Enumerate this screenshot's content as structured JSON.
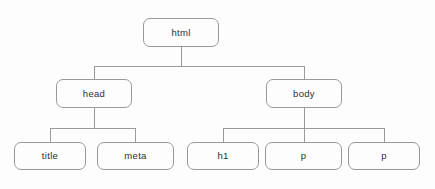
{
  "diagram": {
    "type": "tree-diagram",
    "style": {
      "background": "#fdfdfd",
      "node_border": "#9a9a9a",
      "node_fill": "#fdfdfd",
      "connector": "#9a9a9a",
      "text": "#2e2e2e"
    },
    "nodes": [
      {
        "id": "html",
        "label": "html",
        "level": 0,
        "x": 143,
        "y": 18,
        "w": 76,
        "h": 29
      },
      {
        "id": "head",
        "label": "head",
        "level": 1,
        "x": 56,
        "y": 79,
        "w": 76,
        "h": 29
      },
      {
        "id": "body",
        "label": "body",
        "level": 1,
        "x": 266,
        "y": 79,
        "w": 76,
        "h": 29
      },
      {
        "id": "title",
        "label": "title",
        "level": 2,
        "x": 14,
        "y": 142,
        "w": 72,
        "h": 28
      },
      {
        "id": "meta",
        "label": "meta",
        "level": 2,
        "x": 97,
        "y": 142,
        "w": 77,
        "h": 28
      },
      {
        "id": "h1",
        "label": "h1",
        "level": 2,
        "x": 187,
        "y": 142,
        "w": 72,
        "h": 28
      },
      {
        "id": "p1",
        "label": "p",
        "level": 2,
        "x": 265,
        "y": 142,
        "w": 77,
        "h": 28
      },
      {
        "id": "p2",
        "label": "p",
        "level": 2,
        "x": 348,
        "y": 142,
        "w": 72,
        "h": 28
      }
    ],
    "edges": [
      {
        "from": "html",
        "to": "head"
      },
      {
        "from": "html",
        "to": "body"
      },
      {
        "from": "head",
        "to": "title"
      },
      {
        "from": "head",
        "to": "meta"
      },
      {
        "from": "body",
        "to": "h1"
      },
      {
        "from": "body",
        "to": "p1"
      },
      {
        "from": "body",
        "to": "p2"
      }
    ],
    "connectors": {
      "html_stem": {
        "x": 181,
        "y1": 47,
        "y2": 66
      },
      "html_bar": {
        "y": 66,
        "x1": 94,
        "x2": 304
      },
      "html_drop_head": {
        "x": 94,
        "y1": 66,
        "y2": 79
      },
      "html_drop_body": {
        "x": 304,
        "y1": 66,
        "y2": 79
      },
      "head_stem": {
        "x": 94,
        "y1": 108,
        "y2": 128
      },
      "head_bar": {
        "y": 128,
        "x1": 50,
        "x2": 135
      },
      "head_drop_1": {
        "x": 50,
        "y1": 128,
        "y2": 142
      },
      "head_drop_2": {
        "x": 135,
        "y1": 128,
        "y2": 142
      },
      "body_stem": {
        "x": 304,
        "y1": 108,
        "y2": 128
      },
      "body_bar": {
        "y": 128,
        "x1": 223,
        "x2": 384
      },
      "body_drop_1": {
        "x": 223,
        "y1": 128,
        "y2": 142
      },
      "body_drop_2": {
        "x": 304,
        "y1": 128,
        "y2": 142
      },
      "body_drop_3": {
        "x": 384,
        "y1": 128,
        "y2": 142
      }
    }
  }
}
